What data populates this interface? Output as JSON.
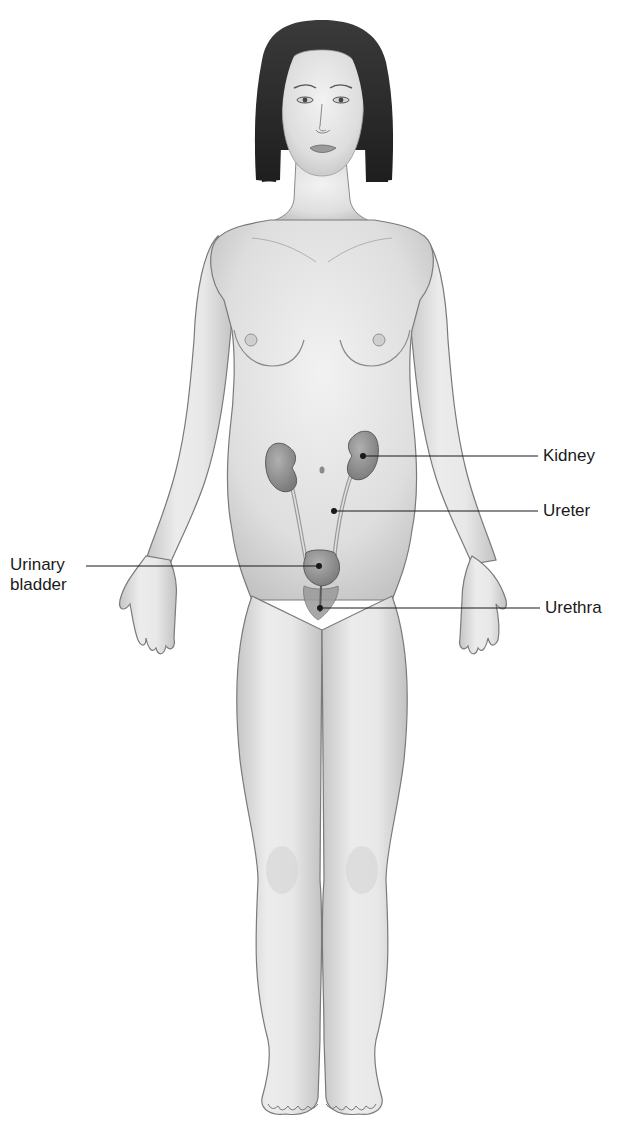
{
  "figure": {
    "colors": {
      "background": "#ffffff",
      "skin_fill": "#e6e6e6",
      "skin_shade": "#bdbdbd",
      "outline": "#6e6e6e",
      "hair": "#2a2a2a",
      "organ_fill": "#8f8f8f",
      "organ_outline": "#5a5a5a",
      "leader_line": "#1a1a1a"
    }
  },
  "labels": {
    "kidney": "Kidney",
    "ureter": "Ureter",
    "urinary_bladder_line1": "Urinary",
    "urinary_bladder_line2": "bladder",
    "urethra": "Urethra"
  }
}
